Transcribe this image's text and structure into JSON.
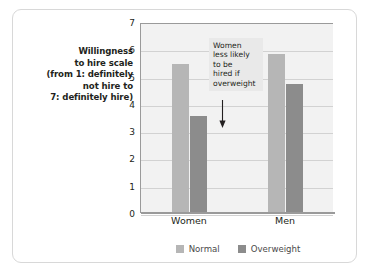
{
  "chart_data": {
    "type": "bar",
    "title": "",
    "xlabel": "",
    "ylabel_lines": [
      "Willingness",
      "to hire scale",
      "(from 1: definitely",
      "not hire to",
      "7: definitely hire)"
    ],
    "categories": [
      "Women",
      "Men"
    ],
    "series": [
      {
        "name": "Normal",
        "color": "#b6b6b6",
        "values": [
          5.5,
          5.85
        ]
      },
      {
        "name": "Overweight",
        "color": "#8c8c8c",
        "values": [
          3.6,
          4.75
        ]
      }
    ],
    "ylim": [
      0,
      7
    ],
    "yticks": [
      7,
      6,
      5,
      4,
      3,
      2,
      1,
      0
    ],
    "grid": true,
    "legend_position": "bottom",
    "annotations": [
      {
        "lines": [
          "Women",
          "less likely",
          "to be",
          "hired if",
          "overweight"
        ],
        "arrow": "down-arrow-icon",
        "points_to": "Women / Overweight bar"
      }
    ],
    "plot_background": "#f2f2f2",
    "axis_color": "#9a9a9a"
  }
}
